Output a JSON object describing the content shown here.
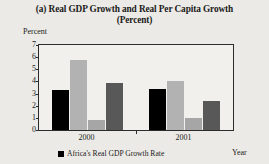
{
  "figure": {
    "title_line1": "(a) Real GDP Growth and Real Per Capita Growth",
    "title_line2": "(Percent)",
    "background_color": "#eceae6",
    "plot_background_color": "#f2f0ed",
    "frame_color": "#2b2b2b"
  },
  "chart_data": {
    "type": "bar",
    "title": "(a) Real GDP Growth and Real Per Capita Growth (Percent)",
    "xlabel": "Year",
    "ylabel": "Percent",
    "ylim": [
      0,
      7
    ],
    "yticks": [
      "0",
      "1",
      "2",
      "3",
      "4",
      "5",
      "6",
      "7"
    ],
    "ytick_values": [
      0,
      1,
      2,
      3,
      4,
      5,
      6,
      7
    ],
    "grid": false,
    "legend_position": "bottom-left",
    "categories": [
      "2000",
      "2001"
    ],
    "series": [
      {
        "name": "Africa's Real GDP Growth Rate",
        "color": "#000000",
        "values": [
          3.3,
          3.4
        ],
        "in_legend": true
      },
      {
        "name": "series-2",
        "color": "#b2b2b2",
        "values": [
          5.8,
          4.0
        ],
        "in_legend": false
      },
      {
        "name": "series-3",
        "color": "#a6a6a6",
        "values": [
          0.8,
          1.0
        ],
        "in_legend": false
      },
      {
        "name": "series-4",
        "color": "#585858",
        "values": [
          3.9,
          2.4
        ],
        "in_legend": false
      }
    ]
  },
  "legend": {
    "entries": [
      {
        "label": "Africa's Real GDP Growth Rate",
        "color": "#000000"
      }
    ]
  }
}
